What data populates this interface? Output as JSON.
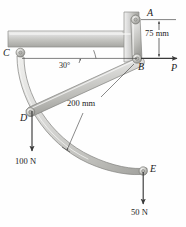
{
  "figure": {
    "background_color": "#fefefe",
    "ink_color": "#1c1c1c",
    "metal_light": "#e8e8e6",
    "metal_mid": "#c6c6c2",
    "metal_dark": "#9a9a96",
    "points": [
      {
        "id": "A",
        "label": "A",
        "x": 150,
        "y": 14
      },
      {
        "id": "B",
        "label": "B",
        "x": 141,
        "y": 61
      },
      {
        "id": "C",
        "label": "C",
        "x": 6,
        "y": 54
      },
      {
        "id": "D",
        "label": "D",
        "x": 27,
        "y": 112
      },
      {
        "id": "E",
        "label": "E",
        "x": 147,
        "y": 172
      }
    ],
    "dimensions": [
      {
        "id": "vertical-75",
        "label": "75 mm",
        "x": 147,
        "y": 28
      },
      {
        "id": "radius-200",
        "label": "200 mm",
        "x": 79,
        "y": 104
      }
    ],
    "angles": [
      {
        "id": "angle-30",
        "label": "30°",
        "x": 62,
        "y": 60
      }
    ],
    "forces": [
      {
        "id": "force-P",
        "label": "P",
        "x": 169,
        "y": 63,
        "direction": "right"
      },
      {
        "id": "force-100N",
        "label": "100 N",
        "x": 18,
        "y": 156,
        "direction": "down"
      },
      {
        "id": "force-50N",
        "label": "50 N",
        "x": 136,
        "y": 210,
        "direction": "down"
      }
    ]
  }
}
